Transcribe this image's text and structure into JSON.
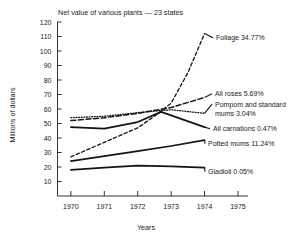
{
  "chart_data": {
    "type": "line",
    "title": "Net value of various plants — 23 states",
    "xlabel": "Years",
    "ylabel": "Millions of dollars",
    "xlim": [
      1969.6,
      1975.3
    ],
    "ylim": [
      0,
      120
    ],
    "grid": false,
    "legend_position": "right-inline-labels",
    "xticks": [
      "1970",
      "1971",
      "1972",
      "1973",
      "1974",
      "1975"
    ],
    "xtick_values": [
      1970,
      1971,
      1972,
      1973,
      1974,
      1975
    ],
    "yticks": [
      "10",
      "20",
      "30",
      "40",
      "50",
      "60",
      "70",
      "80",
      "90",
      "100",
      "110",
      "120"
    ],
    "ytick_values": [
      10,
      20,
      30,
      40,
      50,
      60,
      70,
      80,
      90,
      100,
      110,
      120
    ],
    "series": [
      {
        "name": "Foliage",
        "label": "Foliage 34.77%",
        "percent": "34.77%",
        "style": "fine-dash",
        "x": [
          1970,
          1971,
          1972,
          1972.5,
          1973,
          1973.5,
          1974
        ],
        "values": [
          27,
          37,
          47,
          55,
          64,
          85,
          112
        ]
      },
      {
        "name": "All roses",
        "label": "All roses 5.69%",
        "percent": "5.69%",
        "style": "dash",
        "x": [
          1970,
          1971,
          1972,
          1973,
          1974
        ],
        "values": [
          52,
          54,
          57,
          61,
          68
        ]
      },
      {
        "name": "Pompom and standard mums",
        "label": "Pompom and standard mums 3.04%",
        "percent": "3.04%",
        "style": "dot",
        "x": [
          1970,
          1971,
          1972,
          1973,
          1974
        ],
        "values": [
          54,
          55,
          57.5,
          59.5,
          57
        ]
      },
      {
        "name": "All carnations",
        "label": "All carnations 0.47%",
        "percent": "0.47%",
        "style": "solid",
        "x": [
          1970,
          1971,
          1972,
          1972.7,
          1974
        ],
        "values": [
          47.5,
          46.5,
          51,
          58,
          47.5
        ]
      },
      {
        "name": "Potted mums",
        "label": "Potted mums 11.24%",
        "percent": "11.24%",
        "style": "solid",
        "x": [
          1970,
          1971,
          1972,
          1973,
          1974
        ],
        "values": [
          24,
          27.5,
          31,
          34.5,
          38.5
        ]
      },
      {
        "name": "Gladioli",
        "label": "Gladioli 0.05%",
        "percent": "0.05%",
        "style": "solid",
        "x": [
          1970,
          1971,
          1972,
          1973,
          1974
        ],
        "values": [
          18,
          19.5,
          21,
          20.5,
          19.5
        ]
      }
    ],
    "annotations": [
      {
        "text": "Foliage 34.77%",
        "series": "Foliage"
      },
      {
        "text": "All roses 5.69%",
        "series": "All roses"
      },
      {
        "text": "Pompom and standard",
        "series": "Pompom and standard mums"
      },
      {
        "text": "mums 3.04%",
        "series": "Pompom and standard mums"
      },
      {
        "text": "All carnations 0.47%",
        "series": "All carnations"
      },
      {
        "text": "Potted mums 11.24%",
        "series": "Potted mums"
      },
      {
        "text": "Gladioli 0.05%",
        "series": "Gladioli"
      }
    ]
  }
}
